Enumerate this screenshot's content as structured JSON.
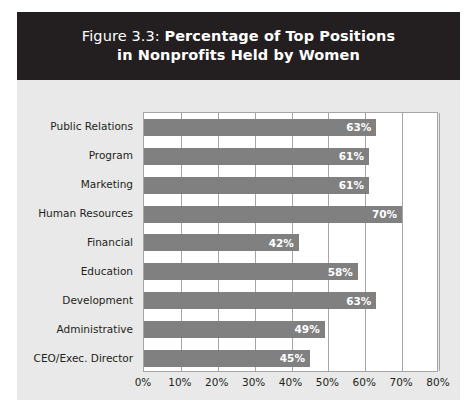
{
  "figure": {
    "title_line_1_prefix": "Figure 3.3: ",
    "title_line_1_strong": "Percentage of Top Positions",
    "title_line_2": "in Nonprofits Held by Women",
    "title_full": "Figure 3.3: Percentage of Top Positions in Nonprofits Held by Women"
  },
  "colors": {
    "banner_background": "#231f20",
    "banner_text": "#ffffff",
    "panel_background": "#e9e9e9",
    "plot_background": "#ffffff",
    "bar_fill": "#808080",
    "bar_label_text": "#ffffff",
    "gridline": "#a6a6a6",
    "axis_text": "#231f20"
  },
  "chart_data": {
    "type": "bar",
    "orientation": "horizontal",
    "title": "Figure 3.3: Percentage of Top Positions in Nonprofits Held by Women",
    "xlabel": "",
    "ylabel": "",
    "categories": [
      "Public Relations",
      "Program",
      "Marketing",
      "Human Resources",
      "Financial",
      "Education",
      "Development",
      "Administrative",
      "CEO/Exec. Director"
    ],
    "values": [
      63,
      61,
      61,
      70,
      42,
      58,
      63,
      49,
      45
    ],
    "value_labels": [
      "63%",
      "61%",
      "61%",
      "70%",
      "42%",
      "58%",
      "63%",
      "49%",
      "45%"
    ],
    "xlim": [
      0,
      80
    ],
    "xticks": [
      0,
      10,
      20,
      30,
      40,
      50,
      60,
      70,
      80
    ],
    "xtick_labels": [
      "0%",
      "10%",
      "20%",
      "30%",
      "40%",
      "50%",
      "60%",
      "70%",
      "80%"
    ],
    "grid": "vertical",
    "legend": "none",
    "data_labels": "inside-end"
  }
}
